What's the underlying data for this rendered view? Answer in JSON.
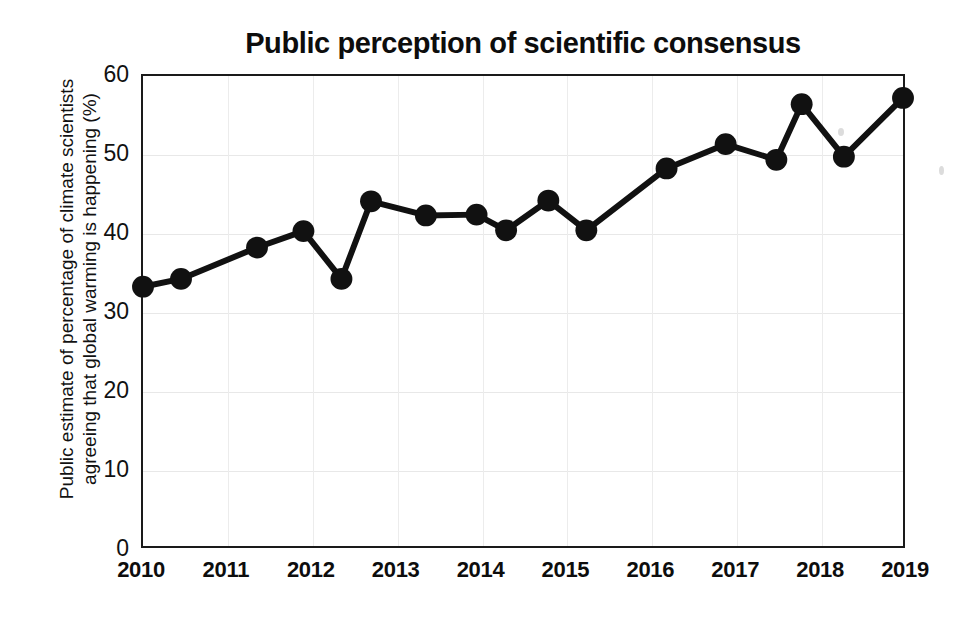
{
  "chart_data": {
    "type": "line",
    "title": "Public perception of scientific consensus",
    "xlabel": "",
    "ylabel": "Public estimate of percentage of climate scientists\nagreeing that global warming is happening (%)",
    "xlim": [
      2010,
      2019
    ],
    "ylim": [
      0,
      60
    ],
    "ytick_labels": [
      "0",
      "10",
      "20",
      "30",
      "40",
      "50",
      "60"
    ],
    "ytick_values": [
      0,
      10,
      20,
      30,
      40,
      50,
      60
    ],
    "xtick_labels": [
      "2010",
      "2011",
      "2012",
      "2013",
      "2014",
      "2015",
      "2016",
      "2017",
      "2018",
      "2019"
    ],
    "xtick_values": [
      2010,
      2011,
      2012,
      2013,
      2014,
      2015,
      2016,
      2017,
      2018,
      2019
    ],
    "grid": true,
    "legend": false,
    "marker": "circle",
    "line_color": "#111111",
    "marker_color": "#111111",
    "x": [
      2010.0,
      2010.45,
      2011.35,
      2011.9,
      2012.35,
      2012.7,
      2013.35,
      2013.95,
      2014.3,
      2014.8,
      2015.25,
      2016.2,
      2016.9,
      2017.5,
      2017.8,
      2018.3,
      2019.0
    ],
    "values": [
      33.1,
      34.1,
      38.1,
      40.2,
      34.1,
      44.0,
      42.2,
      42.3,
      40.3,
      44.1,
      40.3,
      48.2,
      51.3,
      49.3,
      56.4,
      49.7,
      57.2
    ],
    "points": [
      {
        "x": 2010.0,
        "y": 33.1
      },
      {
        "x": 2010.45,
        "y": 34.1
      },
      {
        "x": 2011.35,
        "y": 38.1
      },
      {
        "x": 2011.9,
        "y": 40.2
      },
      {
        "x": 2012.35,
        "y": 34.1
      },
      {
        "x": 2012.7,
        "y": 44.0
      },
      {
        "x": 2013.35,
        "y": 42.2
      },
      {
        "x": 2013.95,
        "y": 42.3
      },
      {
        "x": 2014.3,
        "y": 40.3
      },
      {
        "x": 2014.8,
        "y": 44.1
      },
      {
        "x": 2015.25,
        "y": 40.3
      },
      {
        "x": 2016.2,
        "y": 48.2
      },
      {
        "x": 2016.9,
        "y": 51.3
      },
      {
        "x": 2017.5,
        "y": 49.3
      },
      {
        "x": 2017.8,
        "y": 56.4
      },
      {
        "x": 2018.3,
        "y": 49.7
      },
      {
        "x": 2019.0,
        "y": 57.2
      }
    ]
  }
}
